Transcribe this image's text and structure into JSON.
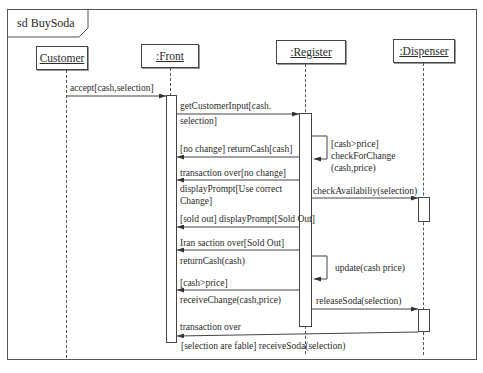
{
  "diagram": {
    "title": "sd BuySoda",
    "lifelines": [
      {
        "name": "Customer"
      },
      {
        "name": ":Front"
      },
      {
        "name": ":Register"
      },
      {
        "name": ":Dispenser"
      }
    ],
    "messages": [
      {
        "label": "accept[cash,selection]",
        "from": "Customer",
        "to": ":Front"
      },
      {
        "label_line1": "getCustomerInput[cash.",
        "label_line2": "selection]",
        "from": ":Front",
        "to": ":Register"
      },
      {
        "label_line1": "[cash>price]",
        "label_line2": "checkForChange",
        "label_line3": "(cash,price)",
        "from": ":Register",
        "to": ":Register"
      },
      {
        "label": "[no change] returnCash[cash]",
        "from": ":Register",
        "to": ":Front"
      },
      {
        "label": "transaction over[no change]",
        "from": ":Register",
        "to": ":Front"
      },
      {
        "label_line1": "displayPrompt[Use correct",
        "label_line2": "Change]",
        "from": ":Register",
        "to": ":Front"
      },
      {
        "label": "checkAvailabiliy(selection)",
        "from": ":Register",
        "to": ":Dispenser"
      },
      {
        "label": "[sold out] displayPrompt[Sold Out]",
        "from": ":Register",
        "to": ":Front"
      },
      {
        "label": "Iran saction over[Sold Out]",
        "from": ":Register",
        "to": ":Front"
      },
      {
        "label": "returnCash(cash)",
        "from": ":Register",
        "to": ":Front"
      },
      {
        "label": "update(cash price)",
        "from": ":Register",
        "to": ":Register"
      },
      {
        "label": "[cash>price]",
        "from": ":Register",
        "to": ":Front"
      },
      {
        "label": "receiveChange(cash,price)",
        "from": ":Register",
        "to": ":Front"
      },
      {
        "label": "releaseSoda(selection)",
        "from": ":Register",
        "to": ":Dispenser"
      },
      {
        "label": "transaction over",
        "from": ":Dispenser",
        "to": ":Front"
      },
      {
        "label": "[selection are fable] receiveSoda(selection)",
        "from": ":Front",
        "to": "Customer"
      }
    ]
  }
}
